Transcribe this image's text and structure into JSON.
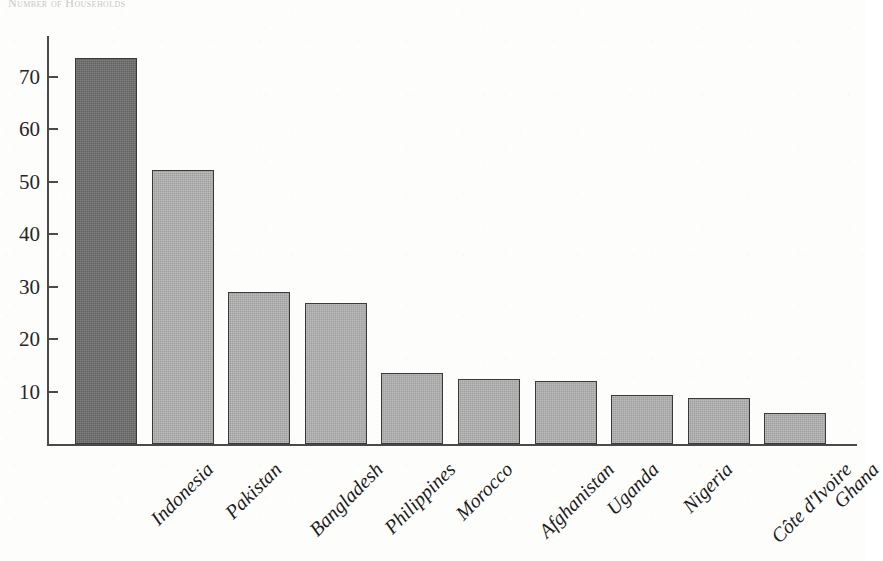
{
  "chart_data": {
    "type": "bar",
    "title": "Number of Households",
    "categories": [
      "Indonesia",
      "Pakistan",
      "Bangladesh",
      "Philippines",
      "Morocco",
      "Afghanistan",
      "Uganda",
      "Nigeria",
      "Côte d'Ivoire",
      "Ghana"
    ],
    "values": [
      73.5,
      52.2,
      29.0,
      26.8,
      13.5,
      12.3,
      12.0,
      9.4,
      8.8,
      6.0
    ],
    "xlabel": "",
    "ylabel": "",
    "ylim": [
      0,
      78
    ],
    "ytick_labels": [
      "10",
      "20",
      "30",
      "40",
      "50",
      "60",
      "70"
    ],
    "ytick_values": [
      10,
      20,
      30,
      40,
      50,
      60,
      70
    ],
    "grid": false,
    "legend": false,
    "colors": {
      "highlight_bar": "#6e6e6e",
      "default_bar": "#b2b2b2",
      "bar_outline": "#3a3a3a",
      "axis": "#4a4a4a",
      "text": "#1c1c1c",
      "background": "#fdfdfc"
    },
    "highlighted_category": "Indonesia",
    "bar_count": 10
  }
}
